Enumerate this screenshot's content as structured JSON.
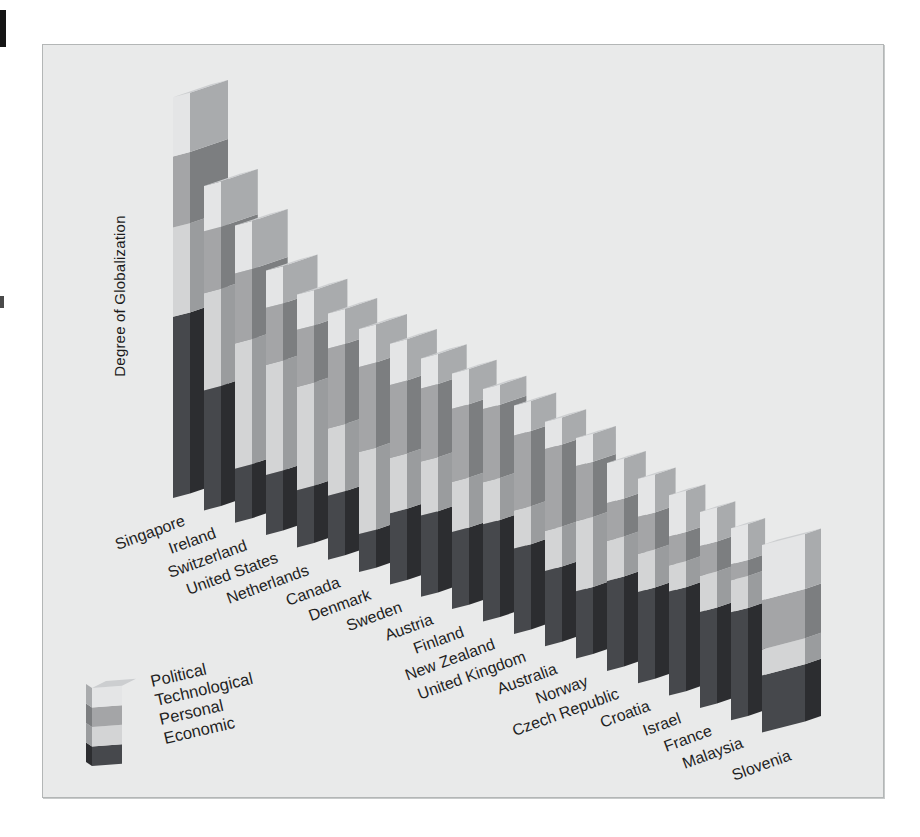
{
  "y_axis_label": "Degree of Globalization",
  "panel": {
    "bg": "#e9eaea",
    "border": "#b3b6b6"
  },
  "text_color": "#1f1f1f",
  "legend": {
    "position": "bottom-left",
    "items": [
      "Political",
      "Technological",
      "Personal",
      "Economic"
    ]
  },
  "series_colors": {
    "Political": {
      "front": "#e4e5e6",
      "side": "#a9abad"
    },
    "Technological": {
      "front": "#a4a5a7",
      "side": "#7c7e80"
    },
    "Personal": {
      "front": "#d3d4d5",
      "side": "#9a9c9e"
    },
    "Economic": {
      "front": "#46484c",
      "side": "#2c2d30"
    }
  },
  "bar_top_color": "#ccced0",
  "chart_data": {
    "type": "bar",
    "variant": "3d-stacked-perspective",
    "title": "",
    "xlabel": "",
    "ylabel": "Degree of Globalization",
    "axis_ticks": "none (no numeric scale shown in figure)",
    "grid": false,
    "legend_position": "bottom-left",
    "units": "relative globalization index estimated from bar heights (Singapore total = 100)",
    "stack_order_bottom_to_top": [
      "Economic",
      "Personal",
      "Technological",
      "Political"
    ],
    "categories": [
      "Singapore",
      "Ireland",
      "Switzerland",
      "United States",
      "Netherlands",
      "Canada",
      "Denmark",
      "Sweden",
      "Austria",
      "Finland",
      "New Zealand",
      "United Kingdom",
      "Australia",
      "Norway",
      "Czech Republic",
      "Croatia",
      "Israel",
      "France",
      "Malaysia",
      "Slovenia"
    ],
    "series": [
      {
        "name": "Economic",
        "values": [
          45.3,
          30.0,
          13.5,
          15.0,
          14.3,
          16.0,
          9.5,
          17.8,
          20.3,
          19.3,
          24.3,
          21.3,
          18.8,
          16.8,
          22.5,
          22.8,
          26.0,
          24.0,
          27.0,
          14.3
        ]
      },
      {
        "name": "Personal",
        "values": [
          22.3,
          24.3,
          31.3,
          27.5,
          25.8,
          16.8,
          20.5,
          13.8,
          13.5,
          12.5,
          10.5,
          9.5,
          10.0,
          17.5,
          10.0,
          9.5,
          6.5,
          9.0,
          8.0,
          6.5
        ]
      },
      {
        "name": "Technological",
        "values": [
          17.8,
          15.5,
          17.5,
          14.3,
          14.3,
          20.0,
          21.3,
          18.3,
          18.3,
          18.3,
          18.3,
          18.8,
          20.5,
          13.8,
          9.5,
          9.3,
          7.3,
          7.5,
          4.0,
          12.3
        ]
      },
      {
        "name": "Political",
        "values": [
          14.8,
          11.3,
          12.0,
          9.3,
          8.8,
          8.8,
          9.5,
          10.3,
          7.5,
          8.8,
          5.0,
          7.5,
          6.8,
          7.0,
          10.0,
          9.5,
          10.3,
          8.5,
          9.0,
          13.8
        ]
      }
    ],
    "totals": [
      100.2,
      81.1,
      74.3,
      66.1,
      63.2,
      61.6,
      60.8,
      60.2,
      59.6,
      58.9,
      58.1,
      57.1,
      56.1,
      55.1,
      52.0,
      51.1,
      50.1,
      49.0,
      48.0,
      46.9
    ]
  }
}
